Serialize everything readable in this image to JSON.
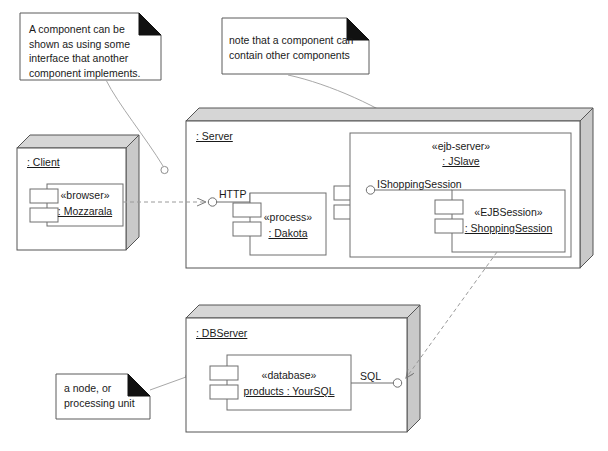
{
  "diagram": {
    "type": "uml-deployment-diagram",
    "colors": {
      "stroke": "#6e6e6e",
      "node_stroke": "#555555",
      "top_face": "#d6d6d6",
      "side_face": "#c9c9c9",
      "background": "#ffffff",
      "text": "#1a1a1a",
      "dashed": "#8a8a8a"
    }
  },
  "notes": [
    {
      "id": "note-interface",
      "text": "A component can be\nshown as using some\ninterface that another\ncomponent implements."
    },
    {
      "id": "note-contains",
      "text": "note that a component can\ncontain other components"
    },
    {
      "id": "note-node",
      "text": "a node, or\nprocessing unit"
    }
  ],
  "nodes": [
    {
      "id": "client",
      "name": ": Client",
      "components": [
        {
          "id": "mozzarala",
          "stereotype": "«browser»",
          "name": ": Mozzarala"
        }
      ]
    },
    {
      "id": "server",
      "name": ": Server",
      "interfaces": [
        {
          "id": "http",
          "label": "HTTP"
        }
      ],
      "components": [
        {
          "id": "dakota",
          "stereotype": "«process»",
          "name": ": Dakota"
        }
      ],
      "inner_nodes": [
        {
          "id": "jslave",
          "stereotype": "«ejb-server»",
          "name": ": JSlave",
          "interfaces": [
            {
              "id": "ishoppingsession",
              "label": "IShoppingSession"
            }
          ],
          "components": [
            {
              "id": "shoppingsession",
              "stereotype": "«EJBSession»",
              "name": ": ShoppingSession"
            }
          ]
        }
      ]
    },
    {
      "id": "dbserver",
      "name": ": DBServer",
      "interfaces": [
        {
          "id": "sql",
          "label": "SQL"
        }
      ],
      "components": [
        {
          "id": "yoursql",
          "stereotype": "«database»",
          "name": "products : YourSQL"
        }
      ]
    }
  ]
}
